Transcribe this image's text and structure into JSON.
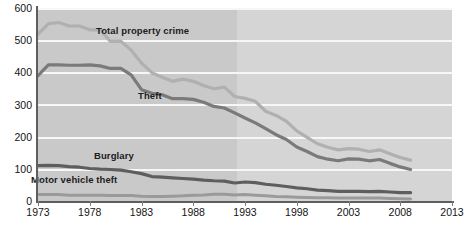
{
  "chart_data": {
    "type": "line",
    "title": "",
    "xlabel": "",
    "ylabel": "",
    "xlim": [
      1973,
      2013
    ],
    "ylim": [
      0,
      600
    ],
    "grid": true,
    "legend_position": "inline-labels",
    "x_ticks": [
      "1973",
      "1978",
      "1983",
      "1988",
      "1993",
      "1998",
      "2003",
      "2008",
      "2013"
    ],
    "y_ticks": [
      "0",
      "100",
      "200",
      "300",
      "400",
      "500",
      "600"
    ],
    "x": [
      1973,
      1974,
      1975,
      1976,
      1977,
      1978,
      1979,
      1980,
      1981,
      1982,
      1983,
      1984,
      1985,
      1986,
      1987,
      1988,
      1989,
      1990,
      1991,
      1992,
      1993,
      1994,
      1995,
      1996,
      1997,
      1998,
      1999,
      2000,
      2001,
      2002,
      2003,
      2004,
      2005,
      2006,
      2007,
      2008,
      2009
    ],
    "shaded_region": {
      "from": 1993,
      "to": 2013,
      "color": "#d5d5d5",
      "note": "lighter background band"
    },
    "series": [
      {
        "name": "Total property crime",
        "color": "#b0b0b0",
        "values": [
          519,
          551,
          555,
          544,
          544,
          532,
          532,
          496,
          497,
          469,
          429,
          399,
          385,
          372,
          379,
          372,
          359,
          349,
          354,
          325,
          319,
          310,
          279,
          266,
          248,
          218,
          198,
          178,
          167,
          159,
          163,
          161,
          154,
          159,
          147,
          135,
          127
        ]
      },
      {
        "name": "Theft",
        "color": "#7a7a7a",
        "values": [
          390,
          423,
          423,
          422,
          422,
          423,
          420,
          412,
          412,
          392,
          346,
          335,
          330,
          318,
          318,
          316,
          307,
          294,
          289,
          274,
          258,
          243,
          225,
          206,
          191,
          168,
          154,
          138,
          130,
          125,
          131,
          130,
          125,
          129,
          117,
          106,
          98
        ]
      },
      {
        "name": "Burglary",
        "color": "#5e5e5e",
        "values": [
          110,
          111,
          110,
          107,
          105,
          101,
          99,
          98,
          96,
          91,
          85,
          76,
          74,
          72,
          70,
          68,
          65,
          63,
          62,
          56,
          59,
          57,
          52,
          49,
          45,
          41,
          38,
          34,
          32,
          30,
          30,
          30,
          29,
          30,
          28,
          26,
          26
        ]
      },
      {
        "name": "Motor vehicle theft",
        "color": "#9a9a9a",
        "values": [
          20,
          20,
          20,
          18,
          18,
          18,
          18,
          17,
          17,
          17,
          15,
          14,
          14,
          15,
          16,
          18,
          19,
          21,
          21,
          19,
          20,
          18,
          16,
          14,
          13,
          12,
          11,
          10,
          10,
          9,
          9,
          9,
          9,
          9,
          8,
          7,
          6
        ]
      }
    ]
  },
  "axis": {
    "y_tick_labels": [
      "600",
      "500",
      "400",
      "300",
      "200",
      "100",
      "0"
    ],
    "x_tick_labels": [
      "1973",
      "1978",
      "1983",
      "1988",
      "1993",
      "1998",
      "2003",
      "2008",
      "2013"
    ]
  },
  "series_labels": {
    "total": "Total property crime",
    "theft": "Theft",
    "burglary": "Burglary",
    "mvt": "Motor vehicle theft"
  },
  "colors": {
    "plot_background": "#c9c9c9",
    "plot_background_late": "#d5d5d5",
    "gridline": "#f7f7f7",
    "axis": "#5e5e5e",
    "total_property_crime": "#b0b0b0",
    "theft": "#7a7a7a",
    "burglary": "#5e5e5e",
    "motor_vehicle_theft": "#9a9a9a"
  }
}
